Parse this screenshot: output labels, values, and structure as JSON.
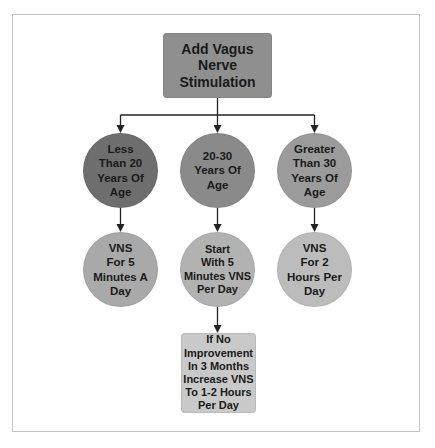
{
  "diagram": {
    "type": "flowchart",
    "root": {
      "label": "Add Vagus\nNerve\nStimulation",
      "shape": "rounded-rectangle",
      "color": "#8f8f8f"
    },
    "branches": [
      {
        "condition": {
          "label": "Less\nThan 20\nYears Of\nAge",
          "shape": "circle",
          "color": "#6e6e6e"
        },
        "action": {
          "label": "VNS\nFor 5\nMinutes A\nDay",
          "shape": "circle",
          "color": "#a9a9a9"
        }
      },
      {
        "condition": {
          "label": "20-30\nYears Of\nAge",
          "shape": "circle",
          "color": "#8a8a8a"
        },
        "action": {
          "label": "Start\nWith 5\nMinutes VNS\nPer Day",
          "shape": "circle",
          "color": "#b2b2b2"
        },
        "followup": {
          "label": "If No\nImprovement\nIn 3 Months\nIncrease VNS\nTo 1-2 Hours\nPer Day",
          "shape": "rounded-rectangle",
          "color": "#c9c9c9"
        }
      },
      {
        "condition": {
          "label": "Greater\nThan 30\nYears Of\nAge",
          "shape": "circle",
          "color": "#9b9b9b"
        },
        "action": {
          "label": "VNS\nFor 2\nHours Per\nDay",
          "shape": "circle",
          "color": "#bcbcbc"
        }
      }
    ],
    "connector_color": "#222222",
    "frame_color": "#c4c4c4"
  }
}
